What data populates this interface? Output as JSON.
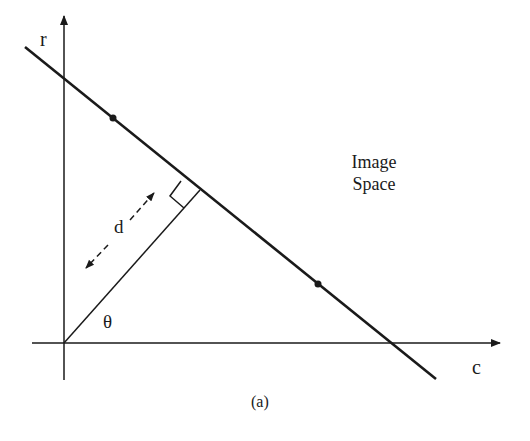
{
  "diagram": {
    "type": "hough-line-normal-parameterization",
    "axes": {
      "vertical_label": "r",
      "horizontal_label": "c"
    },
    "labels": {
      "distance": "d",
      "angle": "θ",
      "region_line1": "Image",
      "region_line2": "Space"
    },
    "caption": "(a)",
    "colors": {
      "ink": "#1a1a1a",
      "background": "#ffffff"
    },
    "points_on_line": 2
  }
}
